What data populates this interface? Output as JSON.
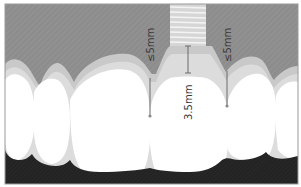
{
  "diagram": {
    "colors": {
      "bone": "#8f8f8f",
      "gingiva_outer": "#c9c9c9",
      "gingiva_inner": "#dcdcdc",
      "teeth": "#ffffff",
      "background_dark": "#262626",
      "implant": "#d8d8d8",
      "implant_threads": "#f4f4f4",
      "measure_line": "#6a6a6a",
      "border": "#9a9a9a"
    },
    "measurements": [
      {
        "id": "left-gap",
        "label": "≤5mm",
        "description": "contact point to bone crest, left"
      },
      {
        "id": "implant-depth",
        "label": "3.5mm",
        "description": "implant shoulder to crown contact"
      },
      {
        "id": "right-gap",
        "label": "≤5mm",
        "description": "contact point to bone crest, right"
      }
    ]
  }
}
